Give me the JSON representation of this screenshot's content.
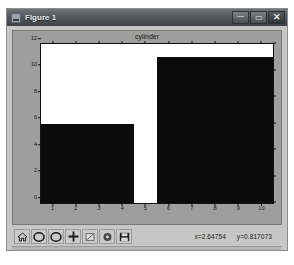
{
  "window": {
    "title": "Figure 1",
    "icon": "figure-window-icon",
    "controls": [
      {
        "name": "minimize",
        "glyph": "—"
      },
      {
        "name": "maximize",
        "glyph": "▭"
      },
      {
        "name": "close",
        "glyph": "✕"
      }
    ]
  },
  "toolbar": {
    "buttons": [
      {
        "name": "home",
        "label": "Home"
      },
      {
        "name": "back",
        "label": "Back"
      },
      {
        "name": "forward",
        "label": "Forward"
      },
      {
        "name": "pan",
        "label": "Pan"
      },
      {
        "name": "zoom",
        "label": "Zoom to rectangle"
      },
      {
        "name": "configure-subplots",
        "label": "Configure subplots"
      },
      {
        "name": "save",
        "label": "Save the figure"
      }
    ],
    "coordinates": {
      "x_label": "x=2.64754",
      "y_label": "y=0.817073"
    }
  },
  "chart_data": {
    "type": "bar",
    "title": "cylinder",
    "xlabel": "",
    "ylabel": "",
    "grid": false,
    "legend": null,
    "xlim": [
      0.5,
      10.5
    ],
    "ylim": [
      0,
      12
    ],
    "xticks": [
      1,
      2,
      3,
      4,
      5,
      6,
      7,
      8,
      9,
      10
    ],
    "xticklabels": [
      "1",
      "2",
      "3",
      "4",
      "5",
      "6",
      "7",
      "8",
      "9",
      "10"
    ],
    "yticks": [
      0,
      2,
      4,
      6,
      8,
      10,
      12
    ],
    "yticklabels": [
      "0",
      "2",
      "4",
      "6",
      "8",
      "10",
      "12"
    ],
    "categories": [
      "4",
      "8"
    ],
    "values": [
      6,
      11
    ],
    "bars": [
      {
        "category": "4",
        "value": 6,
        "left": 0.5,
        "right": 4.5
      },
      {
        "category": "8",
        "value": 11,
        "left": 5.5,
        "right": 10.5
      }
    ],
    "bar_color": "#0b0b0b"
  },
  "colors": {
    "window_face": "#c6c6c6",
    "canvas_face": "#9e9e9e",
    "axes_face": "#ffffff",
    "titlebar": "#55585c",
    "bar": "#0b0b0b"
  }
}
